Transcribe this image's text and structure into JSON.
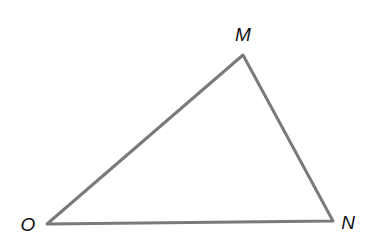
{
  "diagram": {
    "type": "triangle",
    "stroke_color": "#7a7a7a",
    "background": "#ffffff",
    "vertices": [
      {
        "label": "M",
        "x": 243,
        "y": 55,
        "label_x": 243,
        "label_y": 41
      },
      {
        "label": "O",
        "x": 47,
        "y": 224,
        "label_x": 28,
        "label_y": 231
      },
      {
        "label": "N",
        "x": 333,
        "y": 221,
        "label_x": 348,
        "label_y": 229
      }
    ],
    "edges": [
      [
        "O",
        "M"
      ],
      [
        "M",
        "N"
      ],
      [
        "N",
        "O"
      ]
    ]
  }
}
